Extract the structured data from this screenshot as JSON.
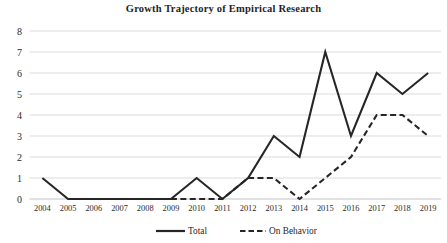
{
  "chart_data": {
    "type": "line",
    "title": "Growth Trajectory of Empirical Research",
    "xlabel": "",
    "ylabel": "",
    "x": [
      2004,
      2005,
      2006,
      2007,
      2008,
      2009,
      2010,
      2011,
      2012,
      2013,
      2014,
      2015,
      2016,
      2017,
      2018,
      2019
    ],
    "categories": [
      "2004",
      "2005",
      "2006",
      "2007",
      "2008",
      "2009",
      "2010",
      "2011",
      "2012",
      "2013",
      "2014",
      "2015",
      "2016",
      "2017",
      "2018",
      "2019"
    ],
    "series": [
      {
        "name": "Total",
        "style": "solid",
        "color": "#262626",
        "values": [
          1,
          0,
          0,
          0,
          0,
          0,
          1,
          0,
          1,
          3,
          2,
          7,
          3,
          6,
          5,
          6
        ]
      },
      {
        "name": "On Behavior",
        "style": "dashed",
        "color": "#262626",
        "values": [
          null,
          null,
          null,
          null,
          null,
          0,
          0,
          0,
          1,
          1,
          0,
          1,
          2,
          4,
          4,
          3
        ]
      }
    ],
    "ylim": [
      0,
      8
    ],
    "yticks": [
      0,
      1,
      2,
      3,
      4,
      5,
      6,
      7,
      8
    ],
    "ytick_labels": [
      "0",
      "1",
      "2",
      "3",
      "4",
      "5",
      "6",
      "7",
      "8"
    ],
    "grid": true,
    "grid_axis": "y",
    "legend_position": "bottom",
    "legend": [
      "Total",
      "On Behavior"
    ]
  },
  "colors": {
    "line": "#262626",
    "grid": "#d2d2d2",
    "text": "#1f1f1f",
    "background": "#ffffff"
  }
}
